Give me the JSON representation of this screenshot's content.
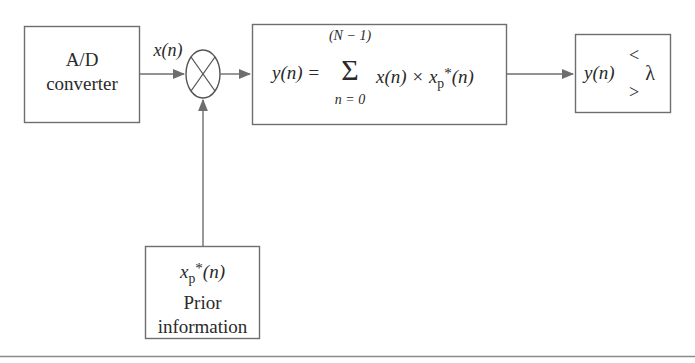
{
  "diagram": {
    "colors": {
      "stroke": "#6e6e6e",
      "text": "#2a2a2a",
      "background": "#ffffff",
      "rule": "#8a8a8a"
    },
    "ad_converter": {
      "line1": "A/D",
      "line2": "converter"
    },
    "signal_label": {
      "var": "x",
      "arg": "(n)"
    },
    "multiplier": {
      "symbol": "circle-cross"
    },
    "correlator": {
      "lhs": "y(n) =",
      "sum_upper": "(N − 1)",
      "sum_symbol": "Σ",
      "sum_lower": "n = 0",
      "term1": "x(n) ×",
      "term2_base": "x",
      "term2_sub": "p",
      "term2_sup": "*",
      "term2_arg": "(n)"
    },
    "decision": {
      "lhs": "y(n)",
      "lt": "<",
      "gt": ">",
      "threshold": "λ"
    },
    "prior": {
      "base": "x",
      "sub": "p",
      "sup": "*",
      "arg": "(n)",
      "line2": "Prior",
      "line3": "information"
    }
  }
}
